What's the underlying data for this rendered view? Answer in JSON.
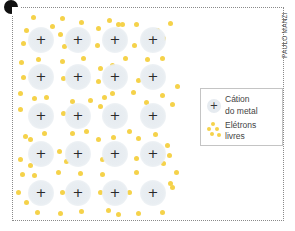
{
  "figure": {
    "credit": "PAULO MANZI",
    "colors": {
      "electron": "#f5d24a",
      "cation_halo": "#e6ebf0",
      "cation_sign": "#2a2a2a",
      "frame": "#8a8a8a"
    },
    "cations": {
      "symbol": "+",
      "columns_x": [
        41,
        78,
        115,
        153
      ],
      "rows_y": [
        40,
        77,
        116,
        154,
        193
      ]
    },
    "electrons": [
      [
        33,
        17
      ],
      [
        62,
        18
      ],
      [
        81,
        22
      ],
      [
        109,
        20
      ],
      [
        118,
        24
      ],
      [
        26,
        30
      ],
      [
        52,
        26
      ],
      [
        60,
        34
      ],
      [
        98,
        28
      ],
      [
        122,
        24
      ],
      [
        136,
        24
      ],
      [
        170,
        23
      ],
      [
        23,
        43
      ],
      [
        64,
        46
      ],
      [
        97,
        45
      ],
      [
        134,
        45
      ],
      [
        157,
        30
      ],
      [
        163,
        38
      ],
      [
        21,
        62
      ],
      [
        38,
        59
      ],
      [
        62,
        61
      ],
      [
        83,
        58
      ],
      [
        100,
        68
      ],
      [
        112,
        65
      ],
      [
        125,
        58
      ],
      [
        147,
        59
      ],
      [
        162,
        58
      ],
      [
        23,
        77
      ],
      [
        63,
        78
      ],
      [
        98,
        81
      ],
      [
        138,
        80
      ],
      [
        150,
        83
      ],
      [
        20,
        93
      ],
      [
        34,
        98
      ],
      [
        46,
        97
      ],
      [
        72,
        101
      ],
      [
        90,
        100
      ],
      [
        104,
        97
      ],
      [
        112,
        93
      ],
      [
        133,
        92
      ],
      [
        146,
        102
      ],
      [
        162,
        95
      ],
      [
        177,
        86
      ],
      [
        20,
        109
      ],
      [
        63,
        113
      ],
      [
        100,
        106
      ],
      [
        172,
        104
      ],
      [
        25,
        136
      ],
      [
        30,
        139
      ],
      [
        44,
        133
      ],
      [
        72,
        133
      ],
      [
        86,
        131
      ],
      [
        98,
        139
      ],
      [
        113,
        137
      ],
      [
        129,
        131
      ],
      [
        138,
        138
      ],
      [
        155,
        134
      ],
      [
        167,
        145
      ],
      [
        20,
        159
      ],
      [
        30,
        165
      ],
      [
        59,
        151
      ],
      [
        66,
        161
      ],
      [
        102,
        159
      ],
      [
        136,
        158
      ],
      [
        169,
        155
      ],
      [
        22,
        174
      ],
      [
        34,
        175
      ],
      [
        58,
        172
      ],
      [
        80,
        173
      ],
      [
        102,
        174
      ],
      [
        136,
        172
      ],
      [
        163,
        163
      ],
      [
        176,
        172
      ],
      [
        18,
        192
      ],
      [
        26,
        202
      ],
      [
        62,
        192
      ],
      [
        100,
        192
      ],
      [
        129,
        192
      ],
      [
        172,
        187
      ],
      [
        37,
        212
      ],
      [
        60,
        213
      ],
      [
        81,
        211
      ],
      [
        108,
        210
      ],
      [
        118,
        214
      ],
      [
        138,
        213
      ],
      [
        162,
        212
      ],
      [
        170,
        183
      ]
    ]
  },
  "legend": {
    "items": [
      {
        "symbol": "+",
        "label_line1": "Cátion",
        "label_line2": "do metal"
      },
      {
        "symbol": "electrons",
        "label_line1": "Elétrons",
        "label_line2": "livres"
      }
    ]
  }
}
